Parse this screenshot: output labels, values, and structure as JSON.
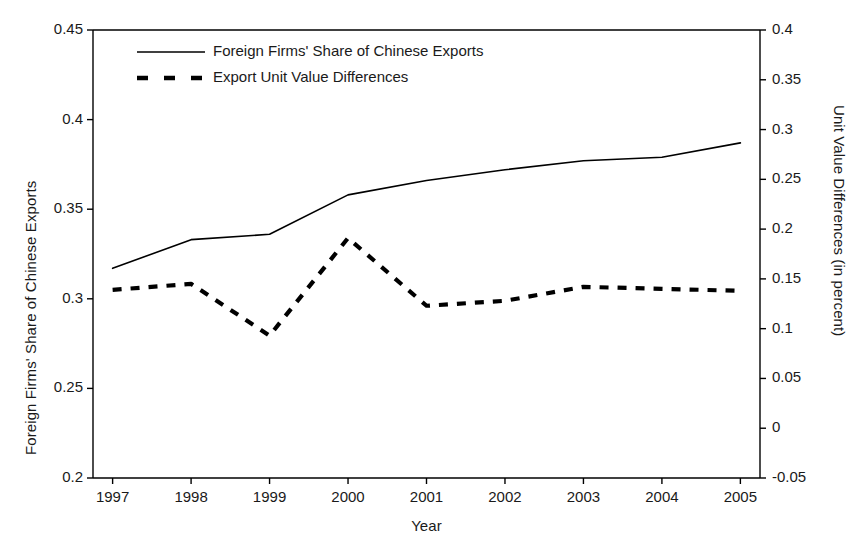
{
  "chart_data": {
    "type": "line",
    "title": "",
    "xlabel": "Year",
    "ylabel": "Foreign Firms' Share of Chinese Exports",
    "y2label": "Unit Value Differences (in percent)",
    "grid": false,
    "legend_position": "top-left",
    "x": [
      1997,
      1998,
      1999,
      2000,
      2001,
      2002,
      2003,
      2004,
      2005
    ],
    "categories": [
      "1997",
      "1998",
      "1999",
      "2000",
      "2001",
      "2002",
      "2003",
      "2004",
      "2005"
    ],
    "xlim": [
      1996.75,
      2005.25
    ],
    "ylim": [
      0.2,
      0.45
    ],
    "y2lim": [
      -0.05,
      0.4
    ],
    "yticks": [
      0.2,
      0.25,
      0.3,
      0.35,
      0.4,
      0.45
    ],
    "ytick_labels": [
      "0.2",
      "0.25",
      "0.3",
      "0.35",
      "0.4",
      "0.45"
    ],
    "y2ticks": [
      -0.05,
      0,
      0.05,
      0.1,
      0.15,
      0.2,
      0.25,
      0.3,
      0.35,
      0.4
    ],
    "y2tick_labels": [
      "-0.05",
      "0",
      "0.05",
      "0.1",
      "0.15",
      "0.2",
      "0.25",
      "0.3",
      "0.35",
      "0.4"
    ],
    "xticks": [
      1997,
      1998,
      1999,
      2000,
      2001,
      2002,
      2003,
      2004,
      2005
    ],
    "xtick_labels": [
      "1997",
      "1998",
      "1999",
      "2000",
      "2001",
      "2002",
      "2003",
      "2004",
      "2005"
    ],
    "series": [
      {
        "name": "Foreign Firms' Share of Chinese Exports",
        "axis": "left",
        "style": "solid",
        "color": "#000000",
        "values": [
          0.317,
          0.333,
          0.336,
          0.358,
          0.366,
          0.372,
          0.377,
          0.379,
          0.387
        ]
      },
      {
        "name": "Export Unit Value Differences",
        "axis": "right",
        "style": "dashed",
        "color": "#000000",
        "values": [
          0.139,
          0.145,
          0.093,
          0.191,
          0.123,
          0.128,
          0.142,
          0.14,
          0.138
        ]
      }
    ]
  },
  "legend": {
    "entries": [
      {
        "label": "Foreign Firms' Share of Chinese Exports",
        "style": "solid"
      },
      {
        "label": "Export Unit Value Differences",
        "style": "dashed"
      }
    ]
  },
  "axes": {
    "x_title": "Year",
    "y_left_title": "Foreign Firms' Share of Chinese Exports",
    "y_right_title": "Unit Value Differences (in percent)"
  },
  "colors": {
    "axis": "#000000",
    "series_solid": "#000000",
    "series_dashed": "#000000",
    "background": "#ffffff"
  }
}
